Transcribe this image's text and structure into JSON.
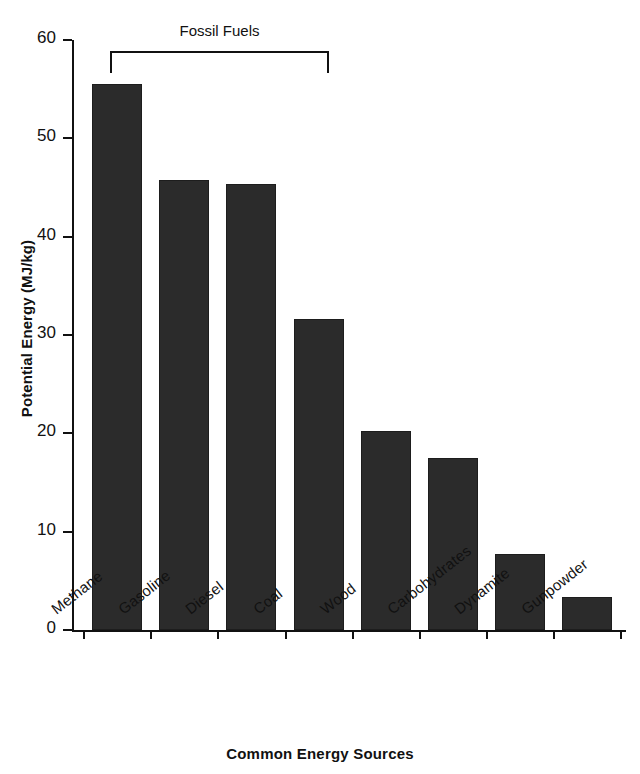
{
  "chart_data": {
    "type": "bar",
    "title": "",
    "categories": [
      "Methane",
      "Gasoline",
      "Diesel",
      "Coal",
      "Wood",
      "Carbohydrates",
      "Dynamite",
      "Gunpowder"
    ],
    "values": [
      55.5,
      45.8,
      45.4,
      31.6,
      20.2,
      17.5,
      7.7,
      3.4
    ],
    "xlabel": "Common Energy Sources",
    "ylabel": "Potential Energy (MJ/kg)",
    "ylim": [
      0,
      60
    ],
    "yticks": [
      0,
      10,
      20,
      30,
      40,
      50,
      60
    ],
    "ytick_labels": [
      "0",
      "10",
      "20",
      "30",
      "40",
      "50",
      "60"
    ],
    "grid": false,
    "legend": null,
    "annotations": [
      {
        "text": "Fossil Fuels",
        "type": "bracket",
        "spans_categories": [
          "Methane",
          "Gasoline",
          "Diesel",
          "Coal"
        ]
      }
    ],
    "bar_color": "#2b2b2b",
    "axis_color": "#111111",
    "background": "#ffffff"
  }
}
